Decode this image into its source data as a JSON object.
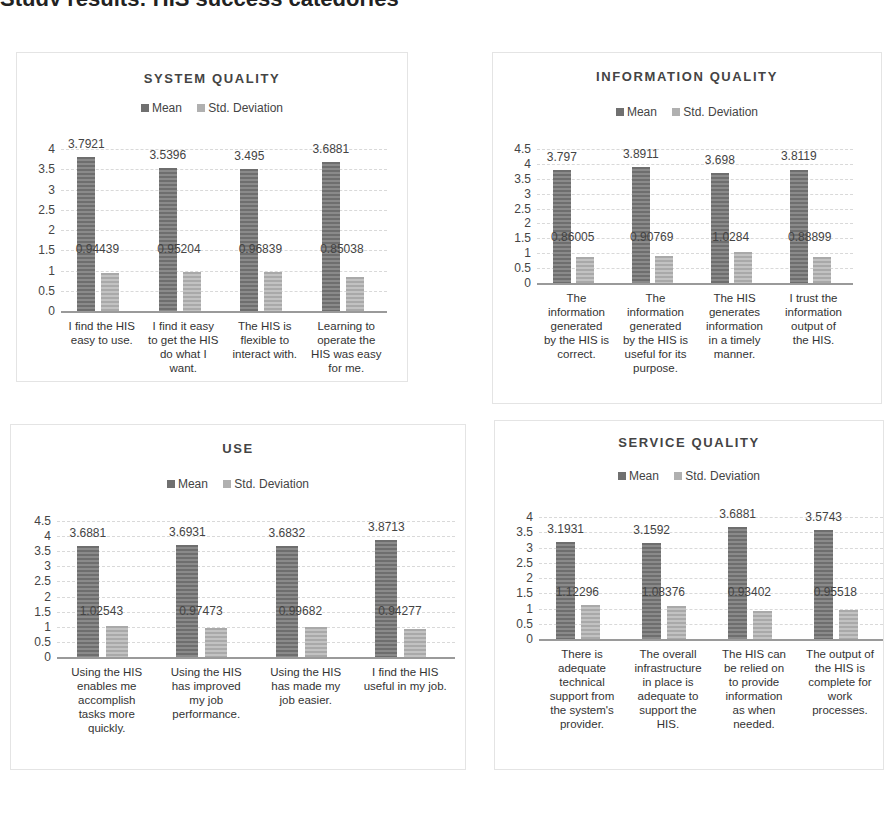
{
  "header_cutoff_text": "Study results: HIS success categories",
  "legend": {
    "mean_label": "Mean",
    "sd_label": "Std. Deviation",
    "mean_color": "#707070",
    "sd_color": "#b0b0b0"
  },
  "chart_data": [
    {
      "type": "bar",
      "title": "SYSTEM QUALITY",
      "categories": [
        "I find the HIS easy to use.",
        "I find it easy to get the HIS do what I want.",
        "The HIS is flexible to interact with.",
        "Learning to operate the HIS was easy for me."
      ],
      "series": [
        {
          "name": "Mean",
          "values": [
            3.7921,
            3.5396,
            3.495,
            3.6881
          ],
          "labels": [
            "3.7921",
            "3.5396",
            "3.495",
            "3.6881"
          ]
        },
        {
          "name": "Std. Deviation",
          "values": [
            0.94439,
            0.95204,
            0.96839,
            0.85038
          ],
          "labels": [
            "0.94439",
            "0.95204",
            "0.96839",
            "0.85038"
          ]
        }
      ],
      "yticks": [
        "0",
        "0.5",
        "1",
        "1.5",
        "2",
        "2.5",
        "3",
        "3.5",
        "4"
      ],
      "ylim": [
        0,
        4
      ],
      "grid": true,
      "legend_position": "top",
      "xlabel": "",
      "ylabel": ""
    },
    {
      "type": "bar",
      "title": "INFORMATION QUALITY",
      "categories": [
        "The information generated by the HIS is correct.",
        "The information generated by the HIS is useful for its purpose.",
        "The HIS generates information in a timely manner.",
        "I trust the information output of the HIS."
      ],
      "series": [
        {
          "name": "Mean",
          "values": [
            3.797,
            3.8911,
            3.698,
            3.8119
          ],
          "labels": [
            "3.797",
            "3.8911",
            "3.698",
            "3.8119"
          ]
        },
        {
          "name": "Std. Deviation",
          "values": [
            0.86005,
            0.90769,
            1.0284,
            0.88899
          ],
          "labels": [
            "0.86005",
            "0.90769",
            "1.0284",
            "0.88899"
          ]
        }
      ],
      "yticks": [
        "0",
        "0.5",
        "1",
        "1.5",
        "2",
        "2.5",
        "3",
        "3.5",
        "4",
        "4.5"
      ],
      "ylim": [
        0,
        4.5
      ],
      "grid": true,
      "legend_position": "top",
      "xlabel": "",
      "ylabel": ""
    },
    {
      "type": "bar",
      "title": "USE",
      "categories": [
        "Using the HIS enables me accomplish tasks more quickly.",
        "Using the HIS has improved my job performance.",
        "Using the HIS has made my job easier.",
        "I find the HIS useful in my job."
      ],
      "series": [
        {
          "name": "Mean",
          "values": [
            3.6881,
            3.6931,
            3.6832,
            3.8713
          ],
          "labels": [
            "3.6881",
            "3.6931",
            "3.6832",
            "3.8713"
          ]
        },
        {
          "name": "Std. Deviation",
          "values": [
            1.02543,
            0.97473,
            0.99682,
            0.94277
          ],
          "labels": [
            "1.02543",
            "0.97473",
            "0.99682",
            "0.94277"
          ]
        }
      ],
      "yticks": [
        "0",
        "0.5",
        "1",
        "1.5",
        "2",
        "2.5",
        "3",
        "3.5",
        "4",
        "4.5"
      ],
      "ylim": [
        0,
        4.5
      ],
      "grid": true,
      "legend_position": "top",
      "xlabel": "",
      "ylabel": ""
    },
    {
      "type": "bar",
      "title": "SERVICE QUALITY",
      "categories": [
        "There is adequate technical support from the system's provider.",
        "The overall infrastructure in place is adequate to support the HIS.",
        "The HIS can be relied on to provide information as when needed.",
        "The output of the HIS is complete for work processes."
      ],
      "series": [
        {
          "name": "Mean",
          "values": [
            3.1931,
            3.1592,
            3.6881,
            3.5743
          ],
          "labels": [
            "3.1931",
            "3.1592",
            "3.6881",
            "3.5743"
          ]
        },
        {
          "name": "Std. Deviation",
          "values": [
            1.12296,
            1.08376,
            0.93402,
            0.95518
          ],
          "labels": [
            "1.12296",
            "1.08376",
            "0.93402",
            "0.95518"
          ]
        }
      ],
      "yticks": [
        "0",
        "0.5",
        "1",
        "1.5",
        "2",
        "2.5",
        "3",
        "3.5",
        "4"
      ],
      "ylim": [
        0,
        4
      ],
      "grid": true,
      "legend_position": "top",
      "xlabel": "",
      "ylabel": ""
    }
  ],
  "xlabel_lines": [
    [
      [
        "I find the HIS",
        "easy to use."
      ],
      [
        "I find it easy",
        "to get the HIS",
        "do what I",
        "want."
      ],
      [
        "The HIS is",
        "flexible to",
        "interact with."
      ],
      [
        "Learning to",
        "operate the",
        "HIS was easy",
        "for me."
      ]
    ],
    [
      [
        "The",
        "information",
        "generated",
        "by the HIS is",
        "correct."
      ],
      [
        "The",
        "information",
        "generated",
        "by the HIS is",
        "useful for its",
        "purpose."
      ],
      [
        "The HIS",
        "generates",
        "information",
        "in a timely",
        "manner."
      ],
      [
        "I trust the",
        "information",
        "output of",
        "the HIS."
      ]
    ],
    [
      [
        "Using the HIS",
        "enables me",
        "accomplish",
        "tasks more",
        "quickly."
      ],
      [
        "Using the HIS",
        "has improved",
        "my job",
        "performance."
      ],
      [
        "Using the HIS",
        "has made my",
        "job easier."
      ],
      [
        "I find the HIS",
        "useful in my job."
      ]
    ],
    [
      [
        "There is",
        "adequate",
        "technical",
        "support from",
        "the system's",
        "provider."
      ],
      [
        "The overall",
        "infrastructure",
        "in place is",
        "adequate to",
        "support the",
        "HIS."
      ],
      [
        "The HIS can",
        "be relied on",
        "to provide",
        "information",
        "as when",
        "needed."
      ],
      [
        "The output of",
        "the HIS is",
        "complete for",
        "work",
        "processes."
      ]
    ]
  ]
}
